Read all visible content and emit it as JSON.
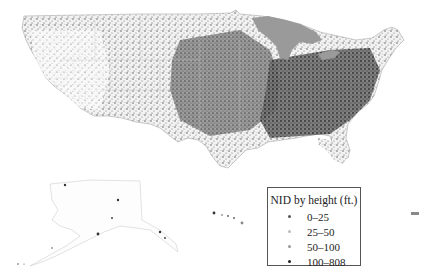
{
  "map": {
    "title": "NID by height (ft.)",
    "regions": [
      "Contiguous United States",
      "Alaska",
      "Hawaii",
      "Puerto Rico"
    ],
    "colors": {
      "land_base": "#e6e6e6",
      "dense_central": "#8a8a8a",
      "dense_east": "#555555",
      "great_lakes": "#9a9a9a",
      "state_borders": "#bbbbbb"
    }
  },
  "legend": {
    "title": "NID by height (ft.)",
    "items": [
      {
        "label": "0–25",
        "color": "#555555"
      },
      {
        "label": "25–50",
        "color": "#bbbbbb"
      },
      {
        "label": "50–100",
        "color": "#999999"
      },
      {
        "label": "100–808",
        "color": "#222222"
      }
    ]
  }
}
